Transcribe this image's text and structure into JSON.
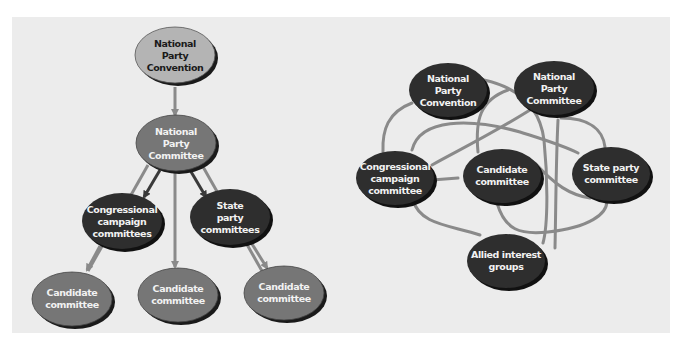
{
  "colors": {
    "panel_bg": "#ececec",
    "node_light": "#b4b4b4",
    "node_medium": "#767676",
    "node_dark": "#2e2e2e",
    "line_gray": "#8a8a8a",
    "arrow_dark": "#3a3a3a",
    "shadow": "#1a1a1a"
  },
  "hierarchy": {
    "title": "Hierarchical party organization",
    "nodes": {
      "convention": [
        "National",
        "Party",
        "Convention"
      ],
      "committee": [
        "National",
        "Party",
        "Committee"
      ],
      "congressional": [
        "Congressional",
        "campaign",
        "committees"
      ],
      "state": [
        "State",
        "party",
        "committees"
      ],
      "candidate_left": [
        "Candidate",
        "committee"
      ],
      "candidate_center": [
        "Candidate",
        "committee"
      ],
      "candidate_right": [
        "Candidate",
        "committee"
      ]
    },
    "edges": [
      {
        "from": "convention",
        "to": "committee"
      },
      {
        "from": "committee",
        "to": "congressional"
      },
      {
        "from": "committee",
        "to": "state"
      },
      {
        "from": "committee",
        "to": "candidate_center"
      },
      {
        "from": "committee",
        "to": "candidate_left"
      },
      {
        "from": "committee",
        "to": "candidate_right"
      },
      {
        "from": "congressional",
        "to": "candidate_left"
      },
      {
        "from": "state",
        "to": "candidate_right"
      }
    ]
  },
  "network": {
    "title": "Networked party organization",
    "nodes": {
      "convention": [
        "National",
        "Party",
        "Convention"
      ],
      "committee": [
        "National",
        "Party",
        "Committee"
      ],
      "congressional": [
        "Congressional",
        "campaign",
        "committee"
      ],
      "candidate": [
        "Candidate",
        "committee"
      ],
      "state": [
        "State party",
        "committee"
      ],
      "allied": [
        "Allied interest",
        "groups"
      ]
    }
  }
}
